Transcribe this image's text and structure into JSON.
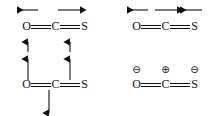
{
  "figure": {
    "background_color": "#ffffff",
    "stroke_color": "#111111",
    "width": 215,
    "height": 116
  },
  "molecule": {
    "formula": "O=C=S",
    "atoms": [
      {
        "symbol": "O",
        "name": "oxygen"
      },
      {
        "symbol": "C",
        "name": "carbon"
      },
      {
        "symbol": "S",
        "name": "sulfur"
      }
    ],
    "bonds": [
      {
        "between": "O-C",
        "order": "double",
        "glyph": "="
      },
      {
        "between": "C-S",
        "order": "double",
        "glyph": "="
      }
    ]
  },
  "panels": {
    "top_left": {
      "name": "asymmetric-stretch-mode",
      "molecule": "O=C=S",
      "arrows": [
        {
          "name": "arrow-left-over-oxygen",
          "direction": "left",
          "glyph": "left-arrow"
        },
        {
          "name": "arrow-right-over-sulfur",
          "direction": "right",
          "glyph": "right-arrow"
        },
        {
          "name": "arrow-up-under-oxygen",
          "direction": "up",
          "glyph": "up-arrow"
        },
        {
          "name": "arrow-up-under-sulfur",
          "direction": "up",
          "glyph": "up-arrow"
        }
      ]
    },
    "top_right": {
      "name": "stretch-mode-opposed",
      "molecule": "O=C=S",
      "arrows": [
        {
          "name": "arrow-left-over-oxygen",
          "direction": "left",
          "glyph": "left-arrow"
        },
        {
          "name": "arrow-right-over-carbon",
          "direction": "right",
          "glyph": "right-arrow"
        },
        {
          "name": "arrow-left-over-sulfur",
          "direction": "left",
          "glyph": "left-arrow"
        }
      ]
    },
    "bottom_left": {
      "name": "bending-mode",
      "molecule": "O=C=S",
      "arrows": [
        {
          "name": "arrow-up-over-oxygen",
          "direction": "up",
          "glyph": "up-arrow"
        },
        {
          "name": "arrow-up-over-sulfur",
          "direction": "up",
          "glyph": "up-arrow"
        },
        {
          "name": "arrow-down-under-carbon",
          "direction": "down",
          "glyph": "down-arrow"
        }
      ]
    },
    "bottom_right": {
      "name": "charge-distribution",
      "molecule": "O=C=S",
      "charges": [
        {
          "name": "negative-charge-on-oxygen",
          "symbol": "⊖",
          "sign": "negative"
        },
        {
          "name": "positive-charge-on-carbon",
          "symbol": "⊕",
          "sign": "positive"
        },
        {
          "name": "negative-charge-on-sulfur",
          "symbol": "⊖",
          "sign": "negative"
        }
      ]
    }
  }
}
